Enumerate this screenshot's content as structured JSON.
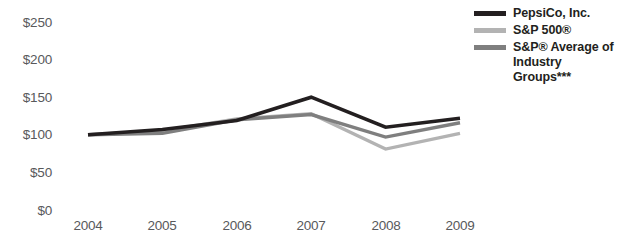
{
  "chart_data": {
    "type": "line",
    "title": "",
    "subtitle": "",
    "xlabel": "",
    "ylabel": "",
    "categories": [
      "2004",
      "2005",
      "2006",
      "2007",
      "2008",
      "2009"
    ],
    "x_tick_labels": [
      "2004",
      "2005",
      "2006",
      "2007",
      "2008",
      "2009"
    ],
    "y_tick_labels": [
      "$0",
      "$50",
      "$100",
      "$150",
      "$200",
      "$250"
    ],
    "y_tick_values": [
      0,
      50,
      100,
      150,
      200,
      250
    ],
    "ylim": [
      0,
      250
    ],
    "grid": false,
    "legend_position": "top-right",
    "series": [
      {
        "name": "PepsiCo, Inc.",
        "color": "#231f20",
        "values": [
          100,
          107,
          119,
          150,
          110,
          122
        ]
      },
      {
        "name": "S&P 500®",
        "color": "#b3b3b3",
        "values": [
          100,
          105,
          121,
          128,
          81,
          102
        ]
      },
      {
        "name": "S&P® Average of Industry Groups***",
        "color": "#7f7f7f",
        "values": [
          100,
          102,
          120,
          127,
          97,
          116
        ]
      }
    ]
  },
  "legend": {
    "items": [
      {
        "label": "PepsiCo, Inc.",
        "color": "#231f20",
        "line1": "PepsiCo, Inc.",
        "line2": ""
      },
      {
        "label": "S&P 500®",
        "color": "#b3b3b3",
        "line1": "S&P 500®",
        "line2": ""
      },
      {
        "label": "S&P® Average of Industry Groups***",
        "color": "#7f7f7f",
        "line1": "S&P® Average of",
        "line2": "Industry Groups***"
      }
    ]
  },
  "axes": {
    "y": {
      "ticks": [
        "$250",
        "$200",
        "$150",
        "$100",
        "$50",
        "$0"
      ]
    },
    "x": {
      "ticks": [
        "2004",
        "2005",
        "2006",
        "2007",
        "2008",
        "2009"
      ]
    }
  },
  "colors": {
    "pepsico": "#231f20",
    "sp500": "#b3b3b3",
    "industry": "#7f7f7f",
    "axis_text": "#58595b",
    "legend_text": "#231f20",
    "background": "#ffffff"
  }
}
